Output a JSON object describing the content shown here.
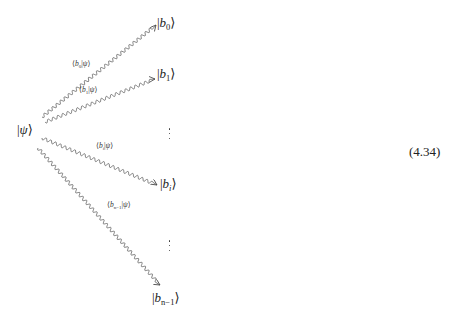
{
  "equation": {
    "number": "(4.34)",
    "source": {
      "label": "|ψ⟩",
      "symbol": "ψ"
    },
    "targets": [
      {
        "id": "b0",
        "base": "b",
        "sub": "0",
        "label": "|b₀⟩"
      },
      {
        "id": "b1",
        "base": "b",
        "sub": "1",
        "label": "|b₁⟩"
      },
      {
        "id": "bi",
        "base": "b",
        "sub": "i",
        "label": "|bᵢ⟩"
      },
      {
        "id": "bn1",
        "base": "b",
        "sub": "n−1",
        "label": "|bₙ₋₁⟩"
      }
    ],
    "coefficients": [
      {
        "id": "c0",
        "base": "b",
        "sub": "0",
        "label": "⟨b₀|ψ⟩"
      },
      {
        "id": "c1",
        "base": "b",
        "sub": "1",
        "label": "⟨b₁|ψ⟩"
      },
      {
        "id": "ci",
        "base": "b",
        "sub": "i",
        "label": "⟨bᵢ|ψ⟩"
      },
      {
        "id": "cn1",
        "base": "b",
        "sub": "n−1",
        "label": "⟨bₙ₋₁|ψ⟩"
      }
    ],
    "ellipses": [
      "⋮",
      "⋮"
    ],
    "arrow_style": "wavy (snake) arrow",
    "color": "#333333"
  }
}
